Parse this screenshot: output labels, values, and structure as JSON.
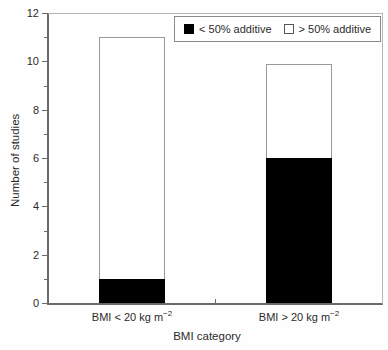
{
  "figure": {
    "background": "#fefefe"
  },
  "legend": {
    "items": [
      {
        "label": "< 50% additive",
        "swatch": "black-filled-square",
        "color": "#000000"
      },
      {
        "label": "> 50% additive",
        "swatch": "white-open-square",
        "color": "#ffffff"
      }
    ]
  },
  "chart_data": {
    "type": "bar",
    "stacked": true,
    "title": "",
    "xlabel": "BMI category",
    "ylabel": "Number of studies",
    "ylim": [
      0,
      12
    ],
    "yticks": [
      0,
      2,
      4,
      6,
      8,
      10,
      12
    ],
    "ytick_step": 2,
    "yminor_step": 1,
    "grid": false,
    "legend_position": "top-right-inside",
    "categories": [
      {
        "base": "BMI < 20 kg m",
        "sup": "−2",
        "text": "BMI < 20 kg m⁻²"
      },
      {
        "base": "BMI > 20 kg m",
        "sup": "−2",
        "text": "BMI > 20 kg m⁻²"
      }
    ],
    "series": [
      {
        "name": "< 50% additive",
        "fill": "#000000",
        "values": [
          1,
          6
        ]
      },
      {
        "name": "> 50% additive",
        "fill": "#ffffff",
        "values": [
          10,
          3.9
        ]
      }
    ],
    "bar_totals": [
      11,
      9.9
    ],
    "colors": {
      "axis": "#6a6a6a",
      "box_border": "#b5b5b5",
      "bar_border": "#999999",
      "text": "#2b2b2b"
    }
  }
}
